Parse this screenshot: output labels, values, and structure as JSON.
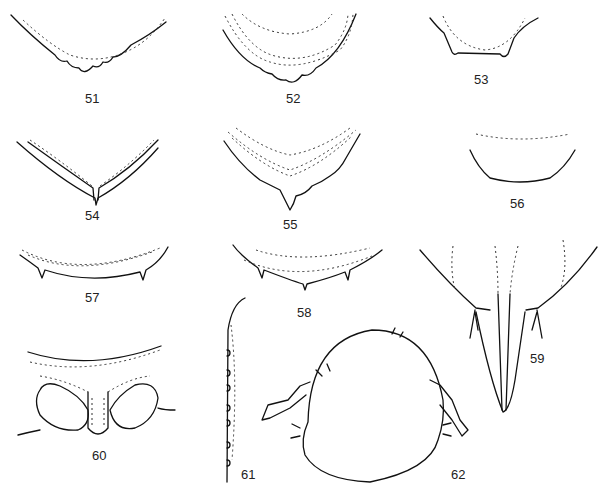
{
  "figure": {
    "type": "plate of morphological line drawings",
    "panels": [
      {
        "id": "51",
        "label": "51",
        "desc": "margin, V-shaped with crenulate lobes"
      },
      {
        "id": "52",
        "label": "52",
        "desc": "margin, U-shaped with crenulate lobes and dotted lines"
      },
      {
        "id": "53",
        "label": "53",
        "desc": "margin with two small teeth"
      },
      {
        "id": "54",
        "label": "54",
        "desc": "V-shaped margin with median spine"
      },
      {
        "id": "55",
        "label": "55",
        "desc": "V-shaped serrate margin with median point"
      },
      {
        "id": "56",
        "label": "56",
        "desc": "rounded trapezoid margin"
      },
      {
        "id": "57",
        "label": "57",
        "desc": "curved margin with lateral teeth"
      },
      {
        "id": "58",
        "label": "58",
        "desc": "curved margin with lateral teeth and median point"
      },
      {
        "id": "59",
        "label": "59",
        "desc": "elongate tapered process"
      },
      {
        "id": "60",
        "label": "60",
        "desc": "paired oval structures with median process"
      },
      {
        "id": "61",
        "label": "61",
        "desc": "lateral edge with small tubercles"
      },
      {
        "id": "62",
        "label": "62",
        "desc": "head capsule with antennae, dorsal view"
      }
    ]
  }
}
